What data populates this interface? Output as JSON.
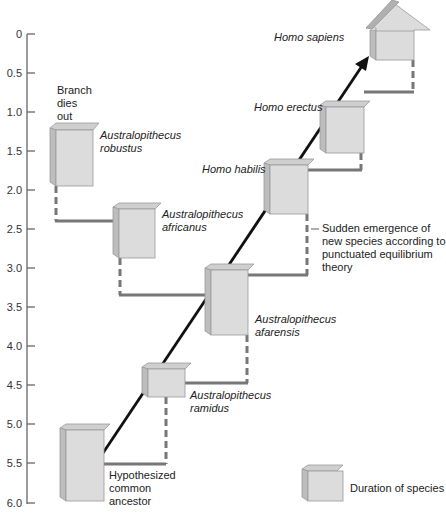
{
  "axis": {
    "ticks": [
      "0",
      "0.5",
      "1.0",
      "1.5",
      "2.0",
      "2.5",
      "3.0",
      "3.5",
      "4.0",
      "4.5",
      "5.0",
      "5.5",
      "6.0"
    ]
  },
  "species": {
    "homo_sapiens": "Homo sapiens",
    "homo_erectus": "Homo erectus",
    "homo_habilis": "Homo habilis",
    "robustus": [
      "Australopithecus",
      "robustus"
    ],
    "africanus": [
      "Australopithecus",
      "africanus"
    ],
    "afarensis": [
      "Australopithecus",
      "afarensis"
    ],
    "ramidus": [
      "Australopithecus",
      "ramidus"
    ],
    "ancestor": [
      "Hypothesized",
      "common",
      "ancestor"
    ]
  },
  "annotations": {
    "branch_dies_out": [
      "Branch",
      "dies",
      "out"
    ],
    "punctuated": [
      "Sudden emergence of",
      "new species according to",
      "punctuated equilibrium",
      "theory"
    ]
  },
  "legend": {
    "label": "Duration of species"
  },
  "colors": {
    "box_front": "#dcdcdc",
    "box_side": "#bdbdbd",
    "box_top": "#cfcfcf",
    "connector": "#777777",
    "main_line": "#111111"
  }
}
